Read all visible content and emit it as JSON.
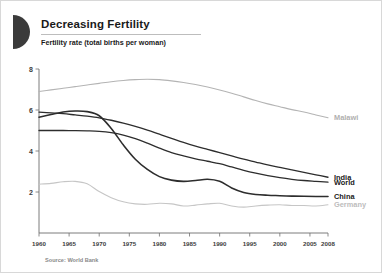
{
  "card": {
    "logo_icon": "half-circle-logo",
    "title": "Decreasing Fertility",
    "subtitle": "Fertility rate (total births per woman)",
    "source": "Source: World Bank"
  },
  "chart_data": {
    "type": "line",
    "title": "Decreasing Fertility",
    "subtitle": "Fertility rate (total births per woman)",
    "xlabel": "",
    "ylabel": "",
    "xlim": [
      1960,
      2008
    ],
    "ylim": [
      0,
      8
    ],
    "yticks": [
      2,
      4,
      6,
      8
    ],
    "xticks": [
      1960,
      1965,
      1970,
      1975,
      1980,
      1985,
      1990,
      1995,
      2000,
      2005,
      2008
    ],
    "xtick_labels": [
      "1960",
      "1965",
      "1970",
      "1975",
      "1980",
      "1985",
      "1990",
      "1995",
      "2000",
      "2005",
      "2008"
    ],
    "ytick_labels": [
      "2",
      "4",
      "6",
      "8"
    ],
    "grid": false,
    "legend_position": "right-inline",
    "x": [
      1960,
      1962,
      1964,
      1966,
      1968,
      1970,
      1972,
      1974,
      1976,
      1978,
      1980,
      1982,
      1984,
      1986,
      1988,
      1990,
      1992,
      1994,
      1996,
      1998,
      2000,
      2002,
      2004,
      2006,
      2008
    ],
    "series": [
      {
        "name": "Malawi",
        "color": "#b4b4b4",
        "label_color": "#b0b0b0",
        "width": 1.1,
        "values": [
          6.9,
          6.98,
          7.06,
          7.14,
          7.22,
          7.3,
          7.38,
          7.44,
          7.48,
          7.5,
          7.48,
          7.42,
          7.34,
          7.24,
          7.12,
          6.98,
          6.82,
          6.64,
          6.46,
          6.3,
          6.16,
          6.02,
          5.9,
          5.76,
          5.62
        ]
      },
      {
        "name": "India",
        "color": "#2d2d2d",
        "label_color": "#1a1a1a",
        "width": 1.3,
        "values": [
          5.9,
          5.86,
          5.82,
          5.76,
          5.7,
          5.62,
          5.5,
          5.36,
          5.2,
          5.02,
          4.82,
          4.62,
          4.42,
          4.24,
          4.08,
          3.92,
          3.76,
          3.6,
          3.46,
          3.32,
          3.2,
          3.08,
          2.96,
          2.84,
          2.72
        ]
      },
      {
        "name": "World",
        "color": "#2d2d2d",
        "label_color": "#1a1a1a",
        "width": 1.3,
        "values": [
          5.0,
          5.0,
          5.0,
          4.99,
          4.98,
          4.96,
          4.9,
          4.78,
          4.6,
          4.38,
          4.14,
          3.92,
          3.76,
          3.62,
          3.5,
          3.38,
          3.22,
          3.06,
          2.92,
          2.8,
          2.7,
          2.62,
          2.56,
          2.52,
          2.48
        ]
      },
      {
        "name": "China",
        "color": "#2d2d2d",
        "label_color": "#1a1a1a",
        "width": 1.6,
        "values": [
          5.65,
          5.78,
          5.9,
          5.95,
          5.92,
          5.72,
          5.1,
          4.3,
          3.6,
          3.1,
          2.75,
          2.58,
          2.52,
          2.56,
          2.62,
          2.52,
          2.2,
          1.98,
          1.88,
          1.84,
          1.82,
          1.8,
          1.79,
          1.78,
          1.78
        ]
      },
      {
        "name": "Germany",
        "color": "#c6c6c6",
        "label_color": "#bdbdbd",
        "width": 1.1,
        "values": [
          2.38,
          2.42,
          2.5,
          2.52,
          2.4,
          2.02,
          1.72,
          1.52,
          1.42,
          1.4,
          1.45,
          1.42,
          1.32,
          1.36,
          1.42,
          1.45,
          1.32,
          1.26,
          1.32,
          1.36,
          1.38,
          1.34,
          1.34,
          1.32,
          1.38
        ]
      }
    ]
  }
}
